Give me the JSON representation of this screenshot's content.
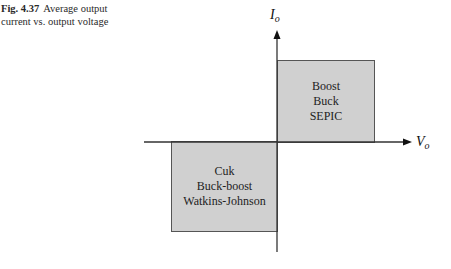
{
  "caption": {
    "figure_number": "Fig. 4.37",
    "line1": "Average output",
    "line2": "current vs. output voltage"
  },
  "axes": {
    "y_label": {
      "main": "I",
      "sub": "o"
    },
    "x_label": {
      "main": "V",
      "sub": "o"
    }
  },
  "quadrants": {
    "first": {
      "position": "positive current, positive voltage",
      "items": [
        "Boost",
        "Buck",
        "SEPIC"
      ]
    },
    "third": {
      "position": "negative current, negative voltage",
      "items": [
        "Cuk",
        "Buck-boost",
        "Watkins-Johnson"
      ]
    }
  },
  "colors": {
    "box_fill": "#d0d0d0",
    "box_border": "#555555",
    "axis": "#333333"
  }
}
